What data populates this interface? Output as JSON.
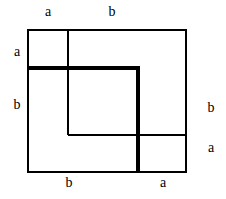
{
  "figure": {
    "background_color": "#ffffff",
    "line_color": "#000000",
    "thin_stroke_width": 1.4,
    "thick_stroke_width": 3.2,
    "canvas": {
      "width": 226,
      "height": 199
    }
  },
  "geometry": {
    "outer_square": {
      "x1": 28,
      "y1": 30,
      "x2": 186,
      "y2": 172
    },
    "thin_vertical_line": {
      "x": 68,
      "y1": 30,
      "y2": 135
    },
    "thin_horizontal_line": {
      "y": 135,
      "x1": 68,
      "x2": 186
    },
    "thick_polyline": {
      "x_start": 28,
      "y_top": 68,
      "x_corner": 138,
      "y_end": 172
    }
  },
  "labels": {
    "top": [
      {
        "text": "a",
        "x": 48,
        "y": 12
      },
      {
        "text": "b",
        "x": 112,
        "y": 12
      }
    ],
    "left": [
      {
        "text": "a",
        "x": 17,
        "y": 52
      },
      {
        "text": "b",
        "x": 17,
        "y": 105
      }
    ],
    "right": [
      {
        "text": "b",
        "x": 211,
        "y": 108
      },
      {
        "text": "a",
        "x": 211,
        "y": 148
      }
    ],
    "bottom": [
      {
        "text": "b",
        "x": 69,
        "y": 179
      },
      {
        "text": "a",
        "x": 163,
        "y": 179
      }
    ]
  }
}
